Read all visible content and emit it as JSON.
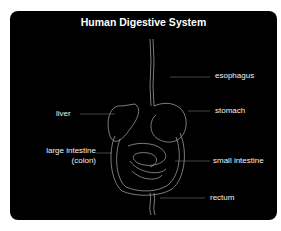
{
  "diagram": {
    "title": "Human Digestive System",
    "background_color": "#000000",
    "line_color": "#cfcfcf",
    "labels": {
      "esophagus": "esophagus",
      "liver": "liver",
      "stomach": "stomach",
      "large_intestine_line1": "large intestine",
      "large_intestine_line2": "(colon)",
      "small_intestine": "small intestine",
      "rectum": "rectum"
    }
  }
}
